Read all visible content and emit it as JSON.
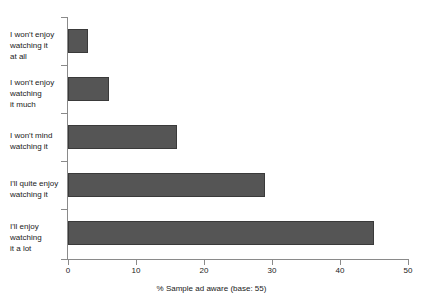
{
  "chart_data": {
    "type": "bar",
    "orientation": "horizontal",
    "title": "",
    "xlabel": "% Sample ad aware (base: 55)",
    "ylabel": "",
    "xlim": [
      0,
      50
    ],
    "xticks": [
      "0",
      "10",
      "20",
      "30",
      "40",
      "50"
    ],
    "grid": false,
    "legend": false,
    "categories": [
      "I won't enjoy watching it at all",
      "I won't enjoy watching it much",
      "I won't mind watching it",
      "I'll quite enjoy watching it",
      "I'll enjoy watching it a lot"
    ],
    "category_lines": [
      [
        "I won't enjoy",
        "watching it",
        "at all"
      ],
      [
        "I won't enjoy",
        "watching",
        "it much"
      ],
      [
        "I won't mind",
        "watching it"
      ],
      [
        "I'll quite enjoy",
        "watching it"
      ],
      [
        "I'll enjoy",
        "watching",
        "it a lot"
      ]
    ],
    "values": [
      3,
      6,
      16,
      29,
      45
    ],
    "bar_color": "#555555",
    "bar_edge_color": "#3a3a3a",
    "axis_color": "#8a8a8a",
    "background_color": "#ffffff"
  }
}
